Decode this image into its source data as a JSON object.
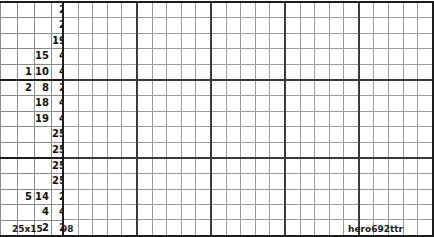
{
  "puzzle": {
    "type": "nonogram",
    "size_label": "25x15",
    "number_label": "98",
    "author_label": "hero692ttr",
    "columns": 25,
    "rows": 15,
    "block_size": 5,
    "colors": {
      "thin_line": "#9a9a9a",
      "thick_line": "#1c1c1c",
      "block_line": "#3a3a3a",
      "text": "#111111",
      "background": "#ffffff"
    },
    "clue_columns": 4,
    "row_clues": [
      [
        "",
        "",
        "",
        "2"
      ],
      [
        "",
        "",
        "",
        "2"
      ],
      [
        "",
        "",
        "",
        "19"
      ],
      [
        "",
        "",
        "15",
        "4"
      ],
      [
        "",
        "1",
        "10",
        "4"
      ],
      [
        "",
        "2",
        "8",
        "2"
      ],
      [
        "",
        "",
        "18",
        "4"
      ],
      [
        "",
        "",
        "19",
        "4"
      ],
      [
        "",
        "",
        "",
        "25"
      ],
      [
        "",
        "",
        "",
        "25"
      ],
      [
        "",
        "",
        "",
        "25"
      ],
      [
        "",
        "",
        "",
        "25"
      ],
      [
        "",
        "5",
        "14",
        "2"
      ],
      [
        "",
        "",
        "4",
        "4"
      ],
      [
        "",
        "",
        "2",
        "2"
      ]
    ]
  }
}
